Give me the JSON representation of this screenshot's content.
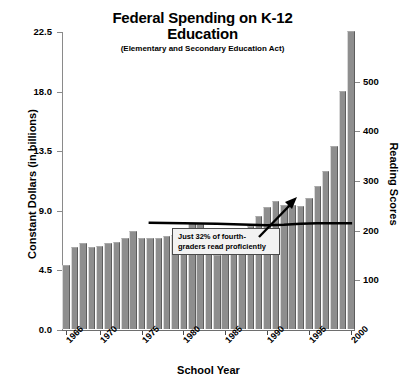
{
  "chart_data": {
    "type": "bar",
    "title": "Federal Spending on K-12 Education",
    "subtitle": "(Elementary and Secondary Education Act)",
    "xlabel": "School Year",
    "ylabel": "Constant Dollars (in billions)",
    "ylabel_right": "Reading Scores",
    "ylim": [
      0.0,
      22.5
    ],
    "ylim_right": [
      0,
      600
    ],
    "yticks": [
      "0.0",
      "4.5",
      "9.0",
      "13.5",
      "18.0",
      "22.5"
    ],
    "ytick_values": [
      0.0,
      4.5,
      9.0,
      13.5,
      18.0,
      22.5
    ],
    "yticks_right": [
      "100",
      "200",
      "300",
      "400",
      "500"
    ],
    "ytick_values_right": [
      100,
      200,
      300,
      400,
      500
    ],
    "xticks": [
      "1966",
      "1970",
      "1975",
      "1980",
      "1985",
      "1990",
      "1995",
      "2000"
    ],
    "xtick_values": [
      1966,
      1970,
      1975,
      1980,
      1985,
      1990,
      1995,
      2000
    ],
    "grid": false,
    "legend": "none",
    "bar_color": "#8e8e8e",
    "line_color": "#000000",
    "categories": [
      1966,
      1967,
      1968,
      1969,
      1970,
      1971,
      1972,
      1973,
      1974,
      1975,
      1976,
      1977,
      1978,
      1979,
      1980,
      1981,
      1982,
      1983,
      1984,
      1985,
      1986,
      1987,
      1988,
      1989,
      1990,
      1991,
      1992,
      1993,
      1994,
      1995,
      1996,
      1997,
      1998,
      1999,
      2000
    ],
    "values": [
      4.8,
      6.2,
      6.5,
      6.2,
      6.3,
      6.5,
      6.6,
      6.9,
      7.4,
      6.9,
      6.9,
      6.9,
      7.0,
      7.1,
      7.4,
      8.0,
      7.9,
      6.7,
      5.6,
      5.7,
      6.6,
      6.9,
      7.8,
      8.5,
      9.2,
      9.7,
      9.4,
      9.4,
      9.3,
      9.9,
      10.8,
      11.9,
      13.8,
      18.0,
      22.5
    ],
    "series": [
      {
        "name": "Federal K-12 Spending",
        "axis": "left",
        "type": "bar",
        "values": [
          4.8,
          6.2,
          6.5,
          6.2,
          6.3,
          6.5,
          6.6,
          6.9,
          7.4,
          6.9,
          6.9,
          6.9,
          7.0,
          7.1,
          7.4,
          8.0,
          7.9,
          6.7,
          5.6,
          5.7,
          6.6,
          6.9,
          7.8,
          8.5,
          9.2,
          9.7,
          9.4,
          9.4,
          9.3,
          9.9,
          10.8,
          11.9,
          13.8,
          18.0,
          22.5
        ]
      },
      {
        "name": "Reading Scores",
        "axis": "right",
        "type": "line",
        "x": [
          1976,
          1980,
          1984,
          1988,
          1990,
          1992,
          1994,
          1996,
          1999,
          2000
        ],
        "values": [
          216,
          215,
          214,
          212,
          211,
          212,
          214,
          215,
          215,
          215
        ]
      }
    ],
    "annotations": [
      {
        "name": "reading-proficiency-note",
        "text": "Just 32% of fourth-graders read proficiently",
        "line1": "Just 32% of fourth-",
        "line2": "graders read proficiently",
        "has_arrow": true,
        "arrow_direction": "up-right"
      }
    ]
  }
}
